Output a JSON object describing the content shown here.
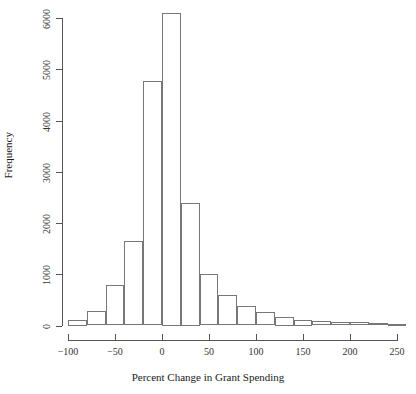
{
  "chart_data": {
    "type": "bar",
    "title": "",
    "subtitle": "",
    "xlabel": "Percent Change in Grant Spending",
    "ylabel": "Frequency",
    "grid": false,
    "legend": null,
    "xlim": [
      -100,
      260
    ],
    "ylim": [
      0,
      6100
    ],
    "bin_width": 20,
    "x_ticks": [
      -100,
      -50,
      0,
      50,
      100,
      150,
      200,
      250
    ],
    "x_tick_labels": [
      "−100",
      "−50",
      "0",
      "50",
      "100",
      "150",
      "200",
      "250"
    ],
    "y_ticks": [
      0,
      1000,
      2000,
      3000,
      4000,
      5000,
      6000
    ],
    "y_tick_labels": [
      "0",
      "1000",
      "2000",
      "3000",
      "4000",
      "5000",
      "6000"
    ],
    "bin_edges": [
      -100,
      -80,
      -60,
      -40,
      -20,
      0,
      20,
      40,
      60,
      80,
      100,
      120,
      140,
      160,
      180,
      200,
      220,
      240,
      260
    ],
    "categories": [
      "-100 to -80",
      "-80 to -60",
      "-60 to -40",
      "-40 to -20",
      "-20 to 0",
      "0 to 20",
      "20 to 40",
      "40 to 60",
      "60 to 80",
      "80 to 100",
      "100 to 120",
      "120 to 140",
      "140 to 160",
      "160 to 180",
      "180 to 200",
      "200 to 220",
      "220 to 240",
      "240 to 260"
    ],
    "values": [
      100,
      280,
      790,
      1640,
      4770,
      6100,
      2400,
      1010,
      590,
      380,
      260,
      175,
      100,
      85,
      70,
      65,
      40,
      30
    ]
  },
  "axis": {
    "x_title": "Percent Change in Grant Spending",
    "y_title": "Frequency"
  }
}
